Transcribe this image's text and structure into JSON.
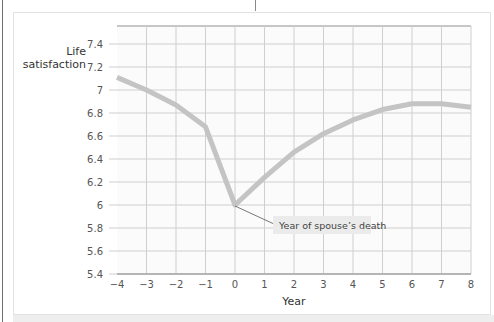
{
  "chart_data": {
    "type": "line",
    "title": "",
    "xlabel": "Year",
    "ylabel": "Life satisfaction",
    "x": [
      -4,
      -3,
      -2,
      -1,
      0,
      1,
      2,
      3,
      4,
      5,
      6,
      7,
      8
    ],
    "series": [
      {
        "name": "Life satisfaction",
        "values": [
          7.11,
          7.0,
          6.87,
          6.68,
          6.0,
          6.24,
          6.46,
          6.62,
          6.74,
          6.83,
          6.88,
          6.88,
          6.85
        ]
      }
    ],
    "xlim": [
      -4,
      8
    ],
    "ylim": [
      5.4,
      7.4
    ],
    "xticks": [
      "−4",
      "−3",
      "−2",
      "−1",
      "0",
      "1",
      "2",
      "3",
      "4",
      "5",
      "6",
      "7",
      "8"
    ],
    "yticks": [
      "7.4",
      "7.2",
      "7",
      "6.8",
      "6.6",
      "6.4",
      "6.2",
      "6",
      "5.8",
      "5.6",
      "5.4"
    ],
    "grid": true,
    "legend": "none",
    "annotations": [
      {
        "text": "Year of spouse’s death",
        "x": 0,
        "y": 6.0
      }
    ],
    "colors": {
      "line": "#c4c4c4",
      "grid": "#cfcfcf",
      "axis": "#b5b5b5",
      "callout_bg": "#ebebeb"
    }
  },
  "labels": {
    "ylabel_line1": "Life",
    "ylabel_line2": "satisfaction",
    "xlabel": "Year",
    "annotation": "Year of spouse’s death"
  }
}
